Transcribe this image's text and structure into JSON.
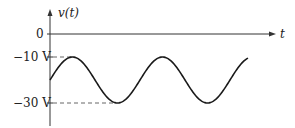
{
  "chart_data": {
    "type": "line",
    "title": "",
    "xlabel": "t",
    "ylabel": "v(t)",
    "y_ticks": [
      {
        "label": "0",
        "value": 0
      },
      {
        "label": "−10 V",
        "value": -10
      },
      {
        "label": "−30 V",
        "value": -30
      }
    ],
    "series": [
      {
        "name": "v(t)",
        "description": "sinusoid with DC offset -20 V and amplitude 10 V, about 2.2 periods shown, starting at -20 V rising",
        "offset": -20,
        "amplitude": 10,
        "max": -10,
        "min": -30,
        "periods_shown": 2.2
      }
    ],
    "reference_lines": [
      {
        "type": "dashed",
        "value": -10
      },
      {
        "type": "dashed",
        "value": -30
      }
    ],
    "grid": false,
    "legend": null
  },
  "labels": {
    "y_axis": "v(t)",
    "x_axis": "t",
    "zero": "0",
    "minus10": "−10 V",
    "minus30": "−30 V"
  },
  "colors": {
    "axis": "#333333",
    "curve": "#1a1a1a",
    "dash": "#555555"
  }
}
